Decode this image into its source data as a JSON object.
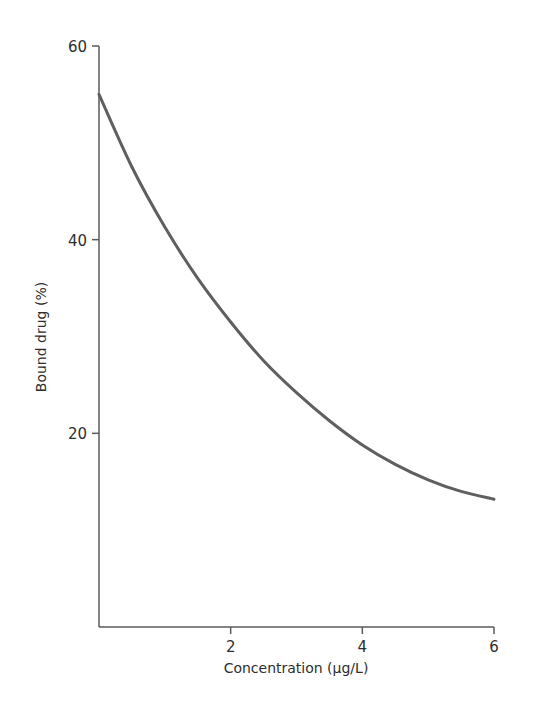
{
  "chart_data": {
    "type": "line",
    "title": "",
    "xlabel": "Concentration (µg/L)",
    "ylabel": "Bound drug (%)",
    "xlim": [
      0,
      6
    ],
    "ylim": [
      0,
      60
    ],
    "x_ticks": [
      2,
      4,
      6
    ],
    "y_ticks": [
      20,
      40,
      60
    ],
    "x_tick_labels": [
      "2",
      "4",
      "6"
    ],
    "y_tick_labels": [
      "20",
      "40",
      "60"
    ],
    "grid": false,
    "legend": null,
    "series": [
      {
        "name": "Bound drug",
        "color": "#5f5f5f",
        "x": [
          0,
          0.5,
          1,
          1.5,
          2,
          2.5,
          3,
          3.5,
          4,
          4.5,
          5,
          5.5,
          6
        ],
        "values": [
          55,
          47.5,
          41.3,
          36,
          31.5,
          27.5,
          24.2,
          21.3,
          18.8,
          16.8,
          15.2,
          14,
          13.2
        ]
      }
    ]
  },
  "colors": {
    "axis": "#5a5a5a",
    "curve": "#5f5f5f",
    "text": "#2e2e2e"
  }
}
